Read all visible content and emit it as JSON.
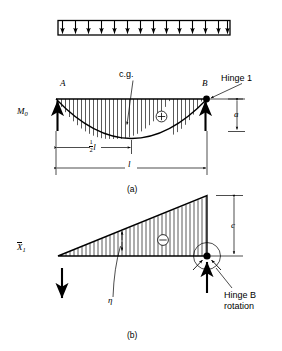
{
  "figure": {
    "background_color": "#ffffff",
    "ink_color": "#000000"
  },
  "load_diagram": {
    "name": "uniformly-distributed-load",
    "arrow_count": 13,
    "direction": "down"
  },
  "diagram_a": {
    "caption": "(a)",
    "ordinate_label": "M",
    "ordinate_subscript": "0",
    "node_left": "A",
    "node_right": "B",
    "centroid_label": "c.g.",
    "hinge_label": "Hinge 1",
    "sign_symbol": "+",
    "dim_half_span_num": "1",
    "dim_half_span_den": "2",
    "dim_half_span_unit": "l",
    "dim_span": "l",
    "dim_offset": "a",
    "shape": "parabola"
  },
  "diagram_b": {
    "caption": "(b)",
    "ordinate_label": "X",
    "ordinate_subscript": "1",
    "ordinate_overbar": true,
    "eta_label": "η",
    "sign_symbol": "−",
    "dim_height": "c",
    "hinge_note_line1": "Hinge B",
    "hinge_note_line2": "rotation",
    "shape": "triangle"
  }
}
